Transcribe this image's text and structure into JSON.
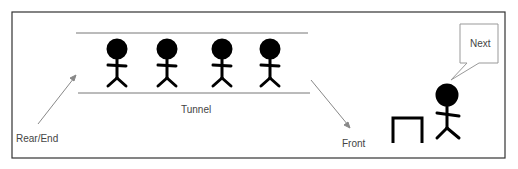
{
  "diagram": {
    "title_labels": {
      "tunnel": "Tunnel",
      "rear": "Rear/End",
      "front": "Front",
      "bubble": "Next"
    },
    "queue_people_count": 4,
    "elements": [
      "tunnel with 4 stick figures in queue",
      "arrow pointing into tunnel from Rear/End",
      "arrow pointing out of tunnel toward Front",
      "counter/desk",
      "person being served with speech bubble"
    ],
    "colors": {
      "line": "#888888",
      "figure": "#000000",
      "border": "#333333"
    }
  }
}
